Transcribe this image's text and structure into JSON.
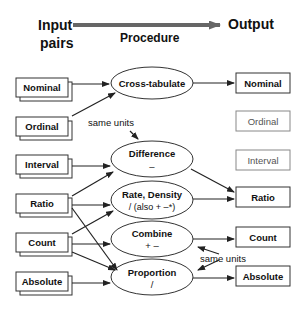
{
  "header": {
    "input_line1": "Input",
    "input_line2": "pairs",
    "procedure": "Procedure",
    "output": "Output"
  },
  "inputs": [
    "Nominal",
    "Ordinal",
    "Interval",
    "Ratio",
    "Count",
    "Absolute"
  ],
  "procedures": [
    {
      "name": "Cross-tabulate",
      "op": ""
    },
    {
      "name": "Difference",
      "op": "–"
    },
    {
      "name": "Rate, Density",
      "op": "/ (also + –*)"
    },
    {
      "name": "Combine",
      "op": "+ –"
    },
    {
      "name": "Proportion",
      "op": "/"
    }
  ],
  "outputs": [
    {
      "name": "Nominal",
      "active": true
    },
    {
      "name": "Ordinal",
      "active": false
    },
    {
      "name": "Interval",
      "active": false
    },
    {
      "name": "Ratio",
      "active": true
    },
    {
      "name": "Count",
      "active": true
    },
    {
      "name": "Absolute",
      "active": true
    }
  ],
  "annotations": {
    "same_units_top": "same units",
    "same_units_bottom": "same units"
  },
  "colors": {
    "line": "#222222",
    "inactive_border": "#888888",
    "inactive_text": "#555555",
    "header_arrow": "#666666"
  }
}
